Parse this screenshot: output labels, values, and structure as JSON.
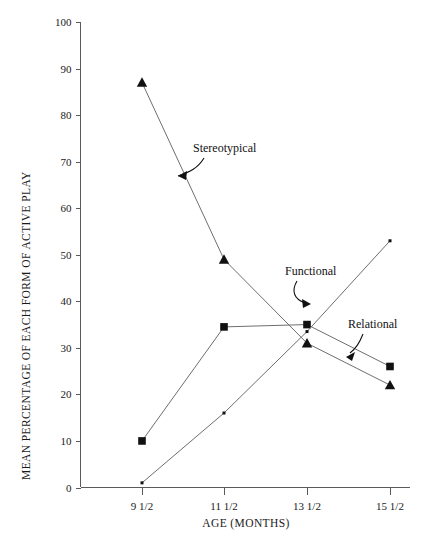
{
  "chart_data": {
    "type": "line",
    "title": "",
    "xlabel": "AGE (MONTHS)",
    "ylabel": "MEAN PERCENTAGE OF EACH FORM OF ACTIVE PLAY",
    "categories": [
      "9 1/2",
      "11 1/2",
      "13 1/2",
      "15 1/2"
    ],
    "x": [
      9.5,
      11.5,
      13.5,
      15.5
    ],
    "ylim": [
      0,
      100
    ],
    "yticks": [
      0,
      10,
      20,
      30,
      40,
      50,
      60,
      70,
      80,
      90,
      100
    ],
    "ytick_labels": [
      "0",
      "10",
      "20",
      "30",
      "40",
      "50",
      "60",
      "70",
      "80",
      "90",
      "100"
    ],
    "grid": false,
    "legend": "none",
    "series": [
      {
        "name": "Stereotypical",
        "marker": "triangle",
        "values": [
          87,
          49,
          31,
          22
        ]
      },
      {
        "name": "Functional",
        "marker": "square",
        "values": [
          10,
          34.5,
          35,
          26
        ]
      },
      {
        "name": "Relational",
        "marker": "dot",
        "values": [
          1,
          16,
          33.5,
          53
        ]
      }
    ],
    "annotations": [
      {
        "label": "Stereotypical",
        "points_to_series": "Stereotypical"
      },
      {
        "label": "Functional",
        "points_to_series": "Functional"
      },
      {
        "label": "Relational",
        "points_to_series": "Relational"
      }
    ]
  }
}
